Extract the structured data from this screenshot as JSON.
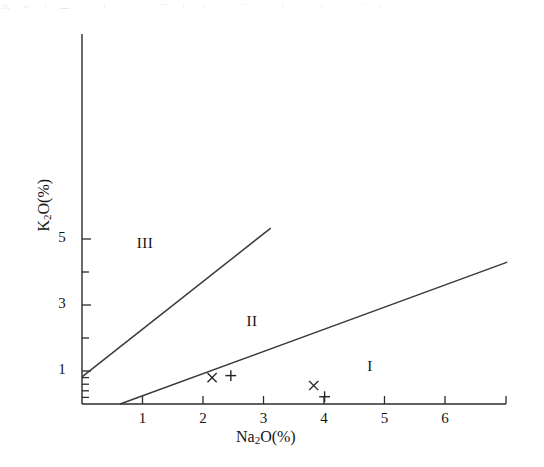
{
  "figure": {
    "artifact_text": "※ ﹖ ｜ ㄧ ＿ ｜ ﹍ ＿ ﹉ ｜ ︱ ﹏ ﹉ ＿ ｜ ﹍ ︱ ＿ ﹉ ｜",
    "background_color": "#ffffff",
    "line_color": "#3a3a3a",
    "axis_color": "#2b2b2b"
  },
  "chart_data": {
    "type": "scatter",
    "title": "",
    "xlabel": "Na₂O(%)",
    "ylabel": "K₂O(%)",
    "xlabel_parts": {
      "pre": "Na",
      "sub": "2",
      "post": "O(%)"
    },
    "ylabel_parts": {
      "pre": "K",
      "sub": "2",
      "post": "O(%)"
    },
    "xlim": [
      0,
      6.95
    ],
    "ylim": [
      0,
      5.55
    ],
    "grid": false,
    "legend": "none",
    "x_ticks_major": [
      1,
      2,
      3,
      4,
      5,
      6
    ],
    "x_tick_labels": [
      "1",
      "2",
      "3",
      "4",
      "5",
      "6"
    ],
    "y_ticks_major": [
      1,
      3,
      5
    ],
    "y_tick_labels": [
      "1",
      "3",
      "5"
    ],
    "y_ticks_minor": [
      0.2,
      0.4,
      0.6,
      0.8,
      2,
      4
    ],
    "series": [
      {
        "name": "cross-markers",
        "marker": "x",
        "points": [
          {
            "x": 2.15,
            "y": 0.8
          },
          {
            "x": 3.83,
            "y": 0.56
          }
        ]
      },
      {
        "name": "plus-markers",
        "marker": "+",
        "points": [
          {
            "x": 2.46,
            "y": 0.86
          },
          {
            "x": 4.01,
            "y": 0.22
          }
        ]
      }
    ],
    "boundary_lines": [
      {
        "name": "field-III-II-boundary",
        "from": {
          "x": 0.0,
          "y": 0.82
        },
        "to": {
          "x": 3.12,
          "y": 5.33
        }
      },
      {
        "name": "field-II-I-boundary",
        "from": {
          "x": 0.63,
          "y": 0.0
        },
        "to": {
          "x": 7.03,
          "y": 4.3
        }
      }
    ],
    "region_labels": [
      {
        "text": "I",
        "x": 4.76,
        "y": 1.1
      },
      {
        "text": "II",
        "x": 2.81,
        "y": 2.45
      },
      {
        "text": "III",
        "x": 1.04,
        "y": 4.82
      }
    ],
    "annotations": []
  }
}
